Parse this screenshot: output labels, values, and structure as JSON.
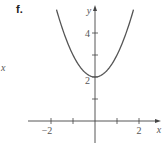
{
  "panel_label": "f.",
  "stray_label": "x",
  "chart_data": {
    "type": "line",
    "title": "",
    "function": "y = x^2 + 2",
    "xlabel": "x",
    "ylabel": "y",
    "xlim": [
      -3,
      3
    ],
    "ylim": [
      -1,
      5
    ],
    "x_ticks": [
      -2,
      -1,
      1,
      2
    ],
    "x_tick_labels": [
      "-2",
      "2"
    ],
    "y_ticks": [
      1,
      2,
      3,
      4
    ],
    "y_tick_labels": [
      "2",
      "4"
    ],
    "grid": false,
    "series": [
      {
        "name": "f",
        "x": [
          -1.75,
          -1.5,
          -1,
          -0.5,
          0,
          0.5,
          1,
          1.5,
          1.75
        ],
        "y": [
          5.06,
          4.25,
          3,
          2.25,
          2,
          2.25,
          3,
          4.25,
          5.06
        ]
      }
    ]
  },
  "colors": {
    "axis": "#444444",
    "curve": "#555555",
    "text": "#555555"
  }
}
